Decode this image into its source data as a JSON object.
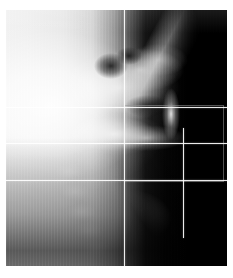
{
  "image": {
    "modality": "lateral-cephalometric-radiograph",
    "title": "Lateral cephalometric radiograph",
    "alt_text": "Grayscale lateral X-ray of skull and cervical spine with white horizontal and vertical reference lines and a rectangular region-of-interest outline",
    "width_px": 233,
    "height_px": 278,
    "plate": {
      "left_px": 6,
      "top_px": 10,
      "width_px": 221,
      "height_px": 256,
      "background_color": "#000000",
      "border_color": "#ffffff"
    },
    "palette": {
      "film_white": "#f2f2f2",
      "film_black": "#000000",
      "midtone": "#9a9a9a",
      "overlay_line": "#ffffff",
      "roi_outline": "#969696",
      "page_background": "#ffffff"
    }
  },
  "overlay": {
    "description": "Cephalometric reference grid overlay",
    "horizontal_lines": [
      {
        "name": "upper-reference-line",
        "y_px": 97,
        "x_start_px": 0,
        "x_end_px": 221
      },
      {
        "name": "middle-reference-line",
        "y_px": 133,
        "x_start_px": 0,
        "x_end_px": 221
      },
      {
        "name": "lower-reference-line",
        "y_px": 170,
        "x_start_px": 0,
        "x_end_px": 221
      },
      {
        "name": "roi-top-edge-line",
        "y_px": 97,
        "x_start_px": 118,
        "x_end_px": 221
      }
    ],
    "vertical_lines": [
      {
        "name": "primary-vertical-line",
        "x_px": 118,
        "y_start_px": 0,
        "y_end_px": 256
      },
      {
        "name": "secondary-vertical-line",
        "x_px": 177,
        "y_start_px": 118,
        "y_end_px": 228
      }
    ],
    "roi_rectangle": {
      "name": "region-of-interest-box",
      "left_px": 118,
      "top_px": 95,
      "width_px": 98,
      "height_px": 75
    }
  },
  "anatomy": {
    "regions": [
      {
        "name": "cranium-soft-tissue-mass",
        "label": "Cranium / soft tissue"
      },
      {
        "name": "skull-base",
        "label": "Skull base"
      },
      {
        "name": "nasal-bone-streak",
        "label": "Nasal bone"
      },
      {
        "name": "airway-sinus-cavity",
        "label": "Airway / sinus"
      },
      {
        "name": "mandible-ramus",
        "label": "Mandible / ramus"
      },
      {
        "name": "cervical-spine",
        "label": "Cervical spine"
      },
      {
        "name": "soft-tissue-profile",
        "label": "Soft tissue profile"
      }
    ]
  }
}
